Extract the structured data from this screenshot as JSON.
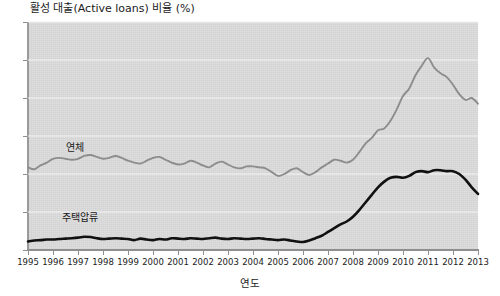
{
  "chart_data": {
    "type": "line",
    "title": "활성 대출(Active loans) 비율 (%)",
    "xlabel": "연도",
    "ylabel": "",
    "xlim": [
      1995,
      2013
    ],
    "ylim": [
      0,
      12
    ],
    "ytick_labels": [
      "0",
      "2",
      "4",
      "6",
      "8",
      "10",
      "12"
    ],
    "ytick_values": [
      0,
      2,
      4,
      6,
      8,
      10,
      12
    ],
    "grid": true,
    "grid_color": "#f4f4f4",
    "plot_background": "#dcdcdc",
    "legend_position": "inline-labels",
    "xtick_labels": [
      "1995",
      "1996",
      "1997",
      "1998",
      "1999",
      "2000",
      "2001",
      "2002",
      "2003",
      "2004",
      "2005",
      "2006",
      "2007",
      "2008",
      "2009",
      "2010",
      "2011",
      "2012",
      "2013"
    ],
    "x": [
      1995.0,
      1995.25,
      1995.5,
      1995.75,
      1996.0,
      1996.25,
      1996.5,
      1996.75,
      1997.0,
      1997.25,
      1997.5,
      1997.75,
      1998.0,
      1998.25,
      1998.5,
      1998.75,
      1999.0,
      1999.25,
      1999.5,
      1999.75,
      2000.0,
      2000.25,
      2000.5,
      2000.75,
      2001.0,
      2001.25,
      2001.5,
      2001.75,
      2002.0,
      2002.25,
      2002.5,
      2002.75,
      2003.0,
      2003.25,
      2003.5,
      2003.75,
      2004.0,
      2004.25,
      2004.5,
      2004.75,
      2005.0,
      2005.25,
      2005.5,
      2005.75,
      2006.0,
      2006.25,
      2006.5,
      2006.75,
      2007.0,
      2007.25,
      2007.5,
      2007.75,
      2008.0,
      2008.25,
      2008.5,
      2008.75,
      2009.0,
      2009.25,
      2009.5,
      2009.75,
      2010.0,
      2010.25,
      2010.5,
      2010.75,
      2011.0,
      2011.25,
      2011.5,
      2011.75,
      2012.0,
      2012.25,
      2012.5,
      2012.75,
      2013.0
    ],
    "series": [
      {
        "name": "연체",
        "color": "#8d8d8d",
        "label_position_year": 1997.4,
        "label_position_value": 5.85,
        "values": [
          4.35,
          4.25,
          4.45,
          4.6,
          4.8,
          4.85,
          4.8,
          4.75,
          4.8,
          4.95,
          5.0,
          4.9,
          4.8,
          4.85,
          4.95,
          4.85,
          4.7,
          4.6,
          4.55,
          4.7,
          4.85,
          4.9,
          4.75,
          4.6,
          4.5,
          4.55,
          4.7,
          4.6,
          4.45,
          4.35,
          4.55,
          4.65,
          4.5,
          4.35,
          4.3,
          4.4,
          4.4,
          4.35,
          4.3,
          4.1,
          3.9,
          4.0,
          4.2,
          4.3,
          4.1,
          3.95,
          4.1,
          4.35,
          4.55,
          4.75,
          4.7,
          4.6,
          4.75,
          5.15,
          5.6,
          5.9,
          6.3,
          6.4,
          6.8,
          7.4,
          8.1,
          8.5,
          9.2,
          9.7,
          10.1,
          9.6,
          9.3,
          9.1,
          8.7,
          8.2,
          7.9,
          8.0,
          7.7
        ]
      },
      {
        "name": "주택압류",
        "color": "#111111",
        "label_position_year": 1997.2,
        "label_position_value": 1.95,
        "values": [
          0.45,
          0.5,
          0.52,
          0.55,
          0.55,
          0.58,
          0.6,
          0.62,
          0.65,
          0.7,
          0.68,
          0.62,
          0.58,
          0.6,
          0.62,
          0.6,
          0.58,
          0.52,
          0.6,
          0.55,
          0.52,
          0.58,
          0.55,
          0.62,
          0.6,
          0.58,
          0.62,
          0.6,
          0.58,
          0.62,
          0.65,
          0.6,
          0.58,
          0.62,
          0.6,
          0.58,
          0.6,
          0.62,
          0.58,
          0.55,
          0.52,
          0.55,
          0.5,
          0.45,
          0.42,
          0.5,
          0.62,
          0.75,
          0.95,
          1.15,
          1.35,
          1.5,
          1.75,
          2.1,
          2.5,
          2.9,
          3.3,
          3.6,
          3.8,
          3.85,
          3.8,
          3.9,
          4.1,
          4.15,
          4.1,
          4.2,
          4.2,
          4.15,
          4.15,
          4.0,
          3.7,
          3.3,
          2.95
        ]
      }
    ]
  }
}
